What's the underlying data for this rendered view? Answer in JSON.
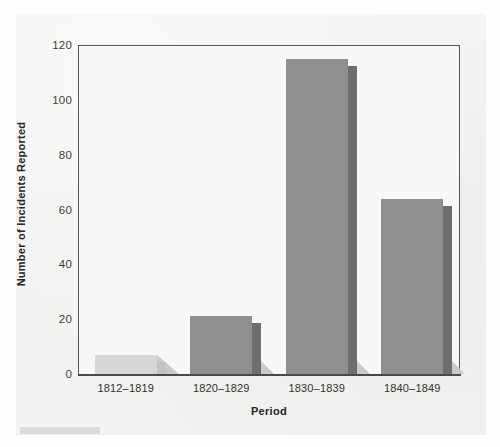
{
  "chart_data": {
    "type": "bar",
    "title": "",
    "xlabel": "Period",
    "ylabel": "Number of Incidents Reported",
    "categories": [
      "1812–1819",
      "1820–1829",
      "1830–1839",
      "1840–1849"
    ],
    "values": [
      7,
      21,
      115,
      64
    ],
    "ylim": [
      0,
      120
    ],
    "yticks": [
      0,
      20,
      40,
      60,
      80,
      100,
      120
    ],
    "ytick_labels": [
      "0",
      "20",
      "40",
      "60",
      "80",
      "100",
      "120"
    ],
    "grid": false,
    "legend": false,
    "bar_colors": [
      "#d6d6d4",
      "#8f8f8d",
      "#8f8f8d",
      "#8f8f8d"
    ],
    "bar_side_colors": [
      "#c2c2c0",
      "#6e6e6c",
      "#6e6e6c",
      "#6e6e6c"
    ],
    "bar_shadow_color": "#c9c9c7",
    "style": {
      "background": "#f3f3f1",
      "plot_background": "#f8f8f6",
      "axis_color": "#4a4946",
      "text_color": "#2b2b29"
    }
  }
}
